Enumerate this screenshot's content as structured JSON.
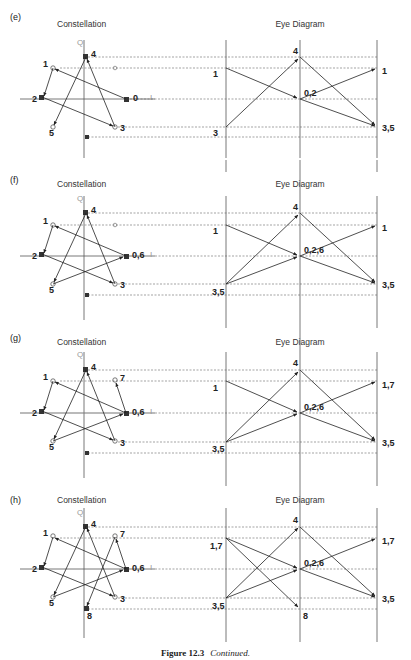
{
  "figure": {
    "caption_label": "Figure 12.3",
    "caption_text": "Continued."
  },
  "colors": {
    "line": "#222222",
    "axis": "#555555",
    "dashed": "#666666",
    "faint_label": "#999999"
  },
  "panels": [
    {
      "id": "e",
      "tag": "(e)",
      "constellation_title": "Constellation",
      "eye_title": "Eye Diagram",
      "axis_q": "Q",
      "axis_i": "I",
      "points": [
        {
          "label": "4",
          "x": 86,
          "y": 57
        },
        {
          "label": "1",
          "x": 53,
          "y": 68
        },
        {
          "label": "0",
          "x": 126,
          "y": 99
        },
        {
          "label": "2",
          "x": 42,
          "y": 97
        },
        {
          "label": "5",
          "x": 53,
          "y": 127
        },
        {
          "label": "3",
          "x": 115,
          "y": 127
        }
      ],
      "eye_left_labels": [
        "1",
        "3"
      ],
      "eye_mid_labels": [
        "4",
        "0,2"
      ],
      "eye_right_labels": [
        "1",
        "3,5"
      ]
    },
    {
      "id": "f",
      "tag": "(f)",
      "constellation_title": "Constellation",
      "eye_title": "Eye Diagram",
      "axis_q": "Q",
      "axis_i": "I",
      "points": [
        {
          "label": "4",
          "x": 86,
          "y": 213
        },
        {
          "label": "1",
          "x": 53,
          "y": 225
        },
        {
          "label": "0,6",
          "x": 126,
          "y": 256
        },
        {
          "label": "2",
          "x": 42,
          "y": 254
        },
        {
          "label": "5",
          "x": 53,
          "y": 284
        },
        {
          "label": "3",
          "x": 115,
          "y": 284
        }
      ],
      "eye_left_labels": [
        "1",
        "3,5"
      ],
      "eye_mid_labels": [
        "4",
        "0,2,6"
      ],
      "eye_right_labels": [
        "1",
        "3,5"
      ]
    },
    {
      "id": "g",
      "tag": "(g)",
      "constellation_title": "Constellation",
      "eye_title": "Eye Diagram",
      "axis_q": "Q",
      "axis_i": "I",
      "points": [
        {
          "label": "4",
          "x": 86,
          "y": 369
        },
        {
          "label": "1",
          "x": 53,
          "y": 381
        },
        {
          "label": "7",
          "x": 115,
          "y": 381
        },
        {
          "label": "0,6",
          "x": 126,
          "y": 412
        },
        {
          "label": "2",
          "x": 42,
          "y": 410
        },
        {
          "label": "5",
          "x": 53,
          "y": 440
        },
        {
          "label": "3",
          "x": 115,
          "y": 440
        }
      ],
      "eye_left_labels": [
        "1",
        "3,5"
      ],
      "eye_mid_labels": [
        "4",
        "0,2,6"
      ],
      "eye_right_labels": [
        "1,7",
        "3,5"
      ]
    },
    {
      "id": "h",
      "tag": "(h)",
      "constellation_title": "Constellation",
      "eye_title": "Eye Diagram",
      "axis_q": "Q",
      "axis_i": "I",
      "points": [
        {
          "label": "4",
          "x": 86,
          "y": 525
        },
        {
          "label": "1",
          "x": 53,
          "y": 537
        },
        {
          "label": "7",
          "x": 115,
          "y": 537
        },
        {
          "label": "0,6",
          "x": 126,
          "y": 568
        },
        {
          "label": "2",
          "x": 42,
          "y": 566
        },
        {
          "label": "5",
          "x": 53,
          "y": 596
        },
        {
          "label": "3",
          "x": 115,
          "y": 596
        },
        {
          "label": "8",
          "x": 86,
          "y": 607
        }
      ],
      "eye_left_labels": [
        "1,7",
        "3,5"
      ],
      "eye_mid_labels": [
        "4",
        "0,2,6",
        "8"
      ],
      "eye_right_labels": [
        "1,7",
        "3,5"
      ]
    }
  ]
}
